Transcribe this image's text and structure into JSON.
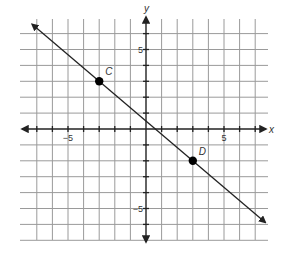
{
  "chart_data": {
    "type": "line",
    "title": "",
    "xlabel": "x",
    "ylabel": "y",
    "xlim": [
      -8,
      8
    ],
    "ylim": [
      -7,
      7
    ],
    "grid": true,
    "grid_x_range": [
      -8,
      7
    ],
    "grid_y_range": [
      -7,
      6
    ],
    "tick_labels_x": [
      {
        "value": -5,
        "label": "−5"
      },
      {
        "value": 5,
        "label": "5"
      }
    ],
    "tick_labels_y": [
      {
        "value": 5,
        "label": "5"
      },
      {
        "value": -5,
        "label": "−5"
      }
    ],
    "series": [
      {
        "name": "line CD",
        "kind": "line-with-arrows",
        "slope": -0.8333,
        "intercept": 0.5,
        "x_range": [
          -7.8,
          7.8
        ],
        "points": [
          {
            "name": "C",
            "x": -3,
            "y": 3
          },
          {
            "name": "D",
            "x": 3,
            "y": -2
          }
        ]
      }
    ],
    "legend": null
  },
  "labels": {
    "x_axis": "x",
    "y_axis": "y",
    "x_neg5": "−5",
    "x_pos5": "5",
    "y_pos5": "5",
    "y_neg5": "−5",
    "point_c": "C",
    "point_d": "D"
  },
  "colors": {
    "grid": "#9a9a9a",
    "axis": "#222222",
    "line": "#222222",
    "point": "#000000"
  }
}
